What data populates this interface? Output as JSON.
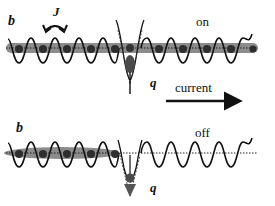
{
  "diagram": {
    "type": "schematic",
    "panels": [
      {
        "id": "top",
        "state_label": "on",
        "site_label": "b",
        "hopping_label": "J",
        "impurity_label": "q",
        "current_label": "current",
        "shows_current_arrow": true,
        "atoms_left": 6,
        "atoms_right": 5,
        "condensate_extent": "full"
      },
      {
        "id": "bottom",
        "state_label": "off",
        "site_label": "b",
        "impurity_label": "q",
        "shows_current_arrow": false,
        "atoms_left": 5,
        "atoms_right": 0,
        "condensate_extent": "left"
      }
    ],
    "colors": {
      "ink": "#111111",
      "condensate": "#8a8a8a",
      "atom": "#3a3a3a",
      "impurity": "#555555"
    }
  }
}
